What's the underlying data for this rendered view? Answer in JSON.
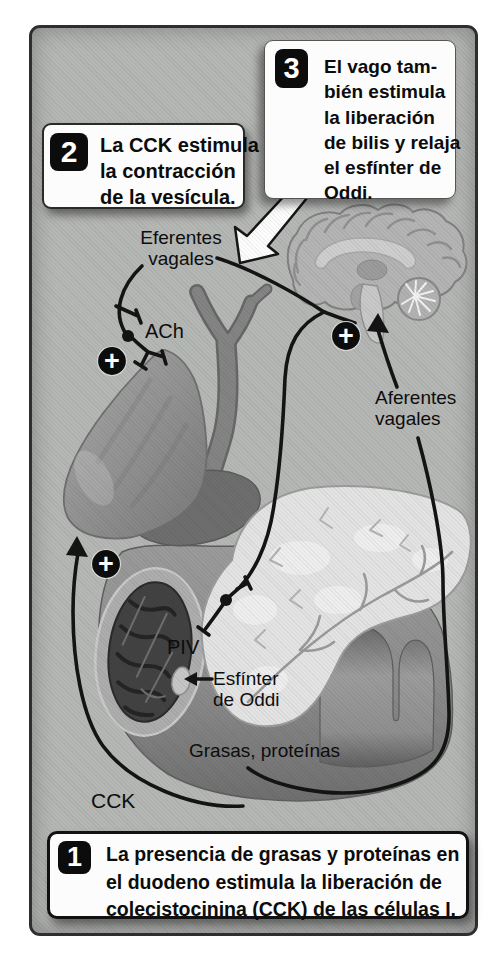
{
  "figure": {
    "page_bg": "#ffffff",
    "panel_bg": "#b5b7b4",
    "panel_border": "#2e2e2e",
    "ink": "#121212",
    "callout_bg": "#fcfcfc"
  },
  "callouts": {
    "box1": {
      "number": "1",
      "lines": [
        "La presencia de grasas y proteínas en",
        "el duodeno estimula la liberación de",
        "colecistocinina (CCK) de las células I."
      ]
    },
    "box2": {
      "number": "2",
      "lines": [
        "La CCK estimula",
        "la contracción",
        "de la vesícula."
      ]
    },
    "box3": {
      "number": "3",
      "lines": [
        "El vago tam-",
        "bién estimula",
        "la liberación",
        "de bilis y relaja",
        "el esfínter de",
        "Oddi."
      ]
    }
  },
  "labels": {
    "eferentes_line1": "Eferentes",
    "eferentes_line2": "vagales",
    "ach": "ACh",
    "aferentes_line1": "Aferentes",
    "aferentes_line2": "vagales",
    "piv": "PIV",
    "esfinter_line1": "Esfínter",
    "esfinter_line2": "de Oddi",
    "grasas": "Grasas, proteínas",
    "cck": "CCK"
  },
  "icons": {
    "plus": "+"
  }
}
